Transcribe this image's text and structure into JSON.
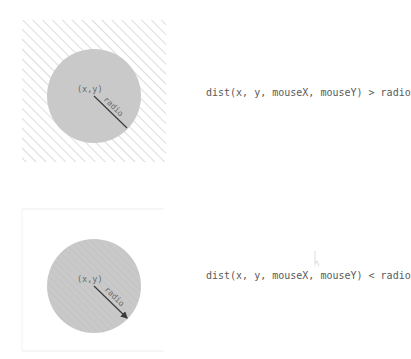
{
  "diagrams": [
    {
      "id": "outside",
      "center_label": "(x,y)",
      "radius_label": "radio",
      "expression": "dist(x, y, mouseX, mouseY) > radio",
      "background": "hatched",
      "radius_line_has_arrow": false
    },
    {
      "id": "inside",
      "center_label": "(x,y)",
      "radius_label": "radio",
      "expression": "dist(x, y, mouseX, mouseY) < radio",
      "background": "plain",
      "radius_line_has_arrow": true
    }
  ],
  "colors": {
    "circle_fill": "#c9c9c9",
    "hatch_stroke": "#d6d6d6",
    "radius_line": "#3a3a3a",
    "label_text": "#6a6a6a",
    "expression_text": "#5a5a5a",
    "frame_stroke": "#eeeeee"
  }
}
